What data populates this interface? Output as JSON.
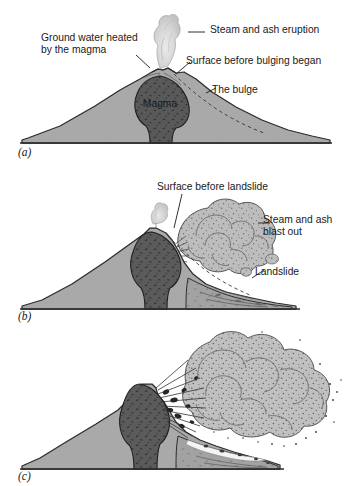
{
  "figure": {
    "background_color": "#ffffff",
    "palette": {
      "mountain_fill": "#a9a9a9",
      "mountain_stroke": "#2b2b2b",
      "magma_fill": "#595959",
      "magma_stroke": "#1f1f1f",
      "cloud_fill": "#b9b9b9",
      "cloud_stroke": "#4a4a4a",
      "steam_fill": "#d8d8d8",
      "ground_line": "#2b2b2b",
      "text_color": "#1a1a1a"
    }
  },
  "panels": [
    {
      "id": "a",
      "letter": "(a)",
      "caption_labels": [
        {
          "name": "ground-water-heated",
          "text": "Ground water heated\nby the magma",
          "line_1": "Ground water heated",
          "line_2": "by the magma"
        },
        {
          "name": "steam-and-ash-eruption",
          "text": "Steam and ash eruption"
        },
        {
          "name": "surface-before-bulging",
          "text": "Surface before bulging began"
        },
        {
          "name": "the-bulge",
          "text": "The bulge"
        }
      ],
      "internal_labels": [
        {
          "name": "magma-label",
          "text": "Magma"
        }
      ]
    },
    {
      "id": "b",
      "letter": "(b)",
      "caption_labels": [
        {
          "name": "surface-before-landslide",
          "text": "Surface before landslide"
        },
        {
          "name": "steam-and-ash-blast-out",
          "text": "Steam and ash\nblast out",
          "line_1": "Steam and ash",
          "line_2": "blast out"
        },
        {
          "name": "landslide",
          "text": "Landslide"
        }
      ],
      "internal_labels": []
    },
    {
      "id": "c",
      "letter": "(c)",
      "caption_labels": [],
      "internal_labels": []
    }
  ]
}
